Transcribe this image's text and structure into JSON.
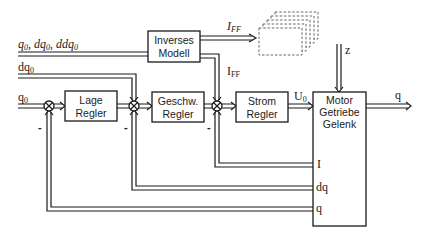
{
  "blocks": {
    "lage_regler": [
      "Lage",
      "Regler"
    ],
    "inverses_modell": [
      "Inverses",
      "Modell"
    ],
    "geschw_regler": [
      "Geschw.",
      "Regler"
    ],
    "strom_regler": [
      "Strom",
      "Regler"
    ],
    "motor": [
      "Motor",
      "Getriebe",
      "Gelenk"
    ]
  },
  "signals": {
    "feedforward_inputs": "q0, dq0, ddq0",
    "dq0": "dq0",
    "q0": "q0",
    "iff_top": "IFF",
    "iff_mid": "IFF",
    "u0": "U0",
    "z": "z",
    "q_out": "q",
    "fb_i": "I",
    "fb_dq": "dq",
    "fb_q": "q"
  },
  "summing_signs": [
    "-",
    "-",
    "-"
  ]
}
